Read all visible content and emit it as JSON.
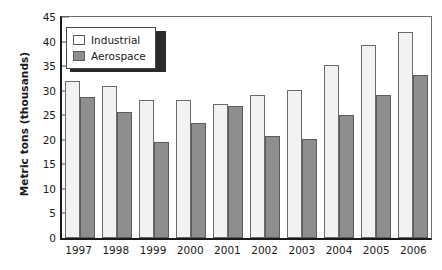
{
  "chart_data": {
    "type": "bar",
    "title": "",
    "xlabel": "",
    "ylabel": "Metric tons (thousands)",
    "categories": [
      "1997",
      "1998",
      "1999",
      "2000",
      "2001",
      "2002",
      "2003",
      "2004",
      "2005",
      "2006"
    ],
    "series": [
      {
        "name": "Industrial",
        "color": "#f2f2f0",
        "values": [
          32.0,
          31.0,
          28.1,
          28.1,
          27.3,
          29.1,
          30.2,
          35.3,
          39.4,
          42.1
        ]
      },
      {
        "name": "Aerospace",
        "color": "#8e8e8e",
        "values": [
          28.8,
          25.7,
          19.6,
          23.4,
          27.0,
          20.9,
          20.2,
          25.1,
          29.2,
          33.2
        ]
      }
    ],
    "ylim": [
      0,
      45
    ],
    "yticks": [
      0,
      5,
      10,
      15,
      20,
      25,
      30,
      35,
      40,
      45
    ],
    "ytick_labels": [
      "0",
      "5",
      "10",
      "15",
      "20",
      "25",
      "30",
      "35",
      "40",
      "45"
    ],
    "grid": false,
    "legend_position": "top-left",
    "legend": [
      {
        "label": "Industrial",
        "swatch": "industrial"
      },
      {
        "label": "Aerospace",
        "swatch": "aerospace"
      }
    ]
  }
}
